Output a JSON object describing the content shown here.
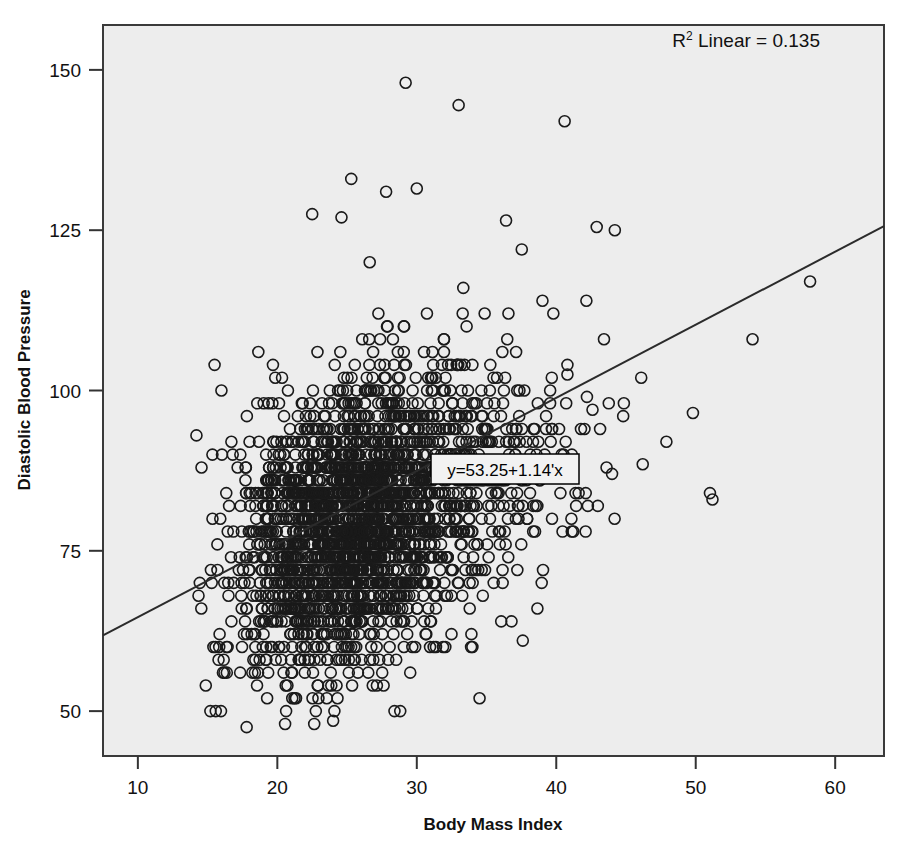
{
  "chart_data": {
    "type": "scatter",
    "title": "",
    "xlabel": "Body Mass Index",
    "ylabel": "Diastolic Blood Pressure",
    "xlim": [
      7.5,
      63.5
    ],
    "ylim": [
      43,
      157
    ],
    "xticks": [
      10,
      20,
      30,
      40,
      50,
      60
    ],
    "xtick_labels": [
      "10",
      "20",
      "30",
      "40",
      "50",
      "60"
    ],
    "yticks": [
      50,
      75,
      100,
      125,
      150
    ],
    "ytick_labels": [
      "50",
      "75",
      "100",
      "125",
      "150"
    ],
    "grid": false,
    "legend": "none",
    "marker": "open-circle",
    "marker_size_px": 11,
    "marker_color": "#1a1a1a",
    "plot_background": "#ededed",
    "page_background": "#ffffff",
    "frame_color": "#3a3a3a",
    "annotations": [
      {
        "name": "r-squared-label",
        "text_prefix": "R",
        "text_superscript": "2",
        "text_suffix": " Linear = 0.135",
        "full_text": "R2 Linear = 0.135",
        "x_px": 820,
        "y_px": 47,
        "anchor": "end",
        "boxed": false
      },
      {
        "name": "regression-equation-label",
        "full_text": "y=53.25+1.14'x",
        "x_px": 505,
        "y_px": 470,
        "anchor": "middle",
        "boxed": true,
        "box_fill": "#f2f2f2",
        "box_stroke": "#000000"
      }
    ],
    "fit_line": {
      "name": "linear-regression-line",
      "equation": "y=53.25+1.14'x",
      "intercept": 53.25,
      "slope": 1.14,
      "r_squared": 0.135,
      "color": "#2b2b2b",
      "width_px": 2,
      "x_start": 7.5,
      "x_end": 63.5,
      "y_start": 61.8,
      "y_end": 125.6
    },
    "scatter_summary": {
      "n_points_approx": 2600,
      "x_center": 26.0,
      "y_center": 80.0,
      "x_sd": 4.4,
      "y_sd": 11.5,
      "correlation": 0.367,
      "x_min": 14.2,
      "x_max": 58.2,
      "y_min": 47.0,
      "y_max": 148.0,
      "y_quantization": 2.0,
      "note": "Heavily overplotted core between BMI 20-32 and DBP 60-95; sparse outliers to BMI 58 and DBP 148"
    },
    "outlier_points": [
      {
        "x": 29.2,
        "y": 148.0
      },
      {
        "x": 33.0,
        "y": 144.5
      },
      {
        "x": 40.6,
        "y": 142.0
      },
      {
        "x": 25.3,
        "y": 133.0
      },
      {
        "x": 27.8,
        "y": 131.0
      },
      {
        "x": 30.0,
        "y": 131.5
      },
      {
        "x": 22.5,
        "y": 127.5
      },
      {
        "x": 24.6,
        "y": 127.0
      },
      {
        "x": 36.4,
        "y": 126.5
      },
      {
        "x": 42.9,
        "y": 125.5
      },
      {
        "x": 44.2,
        "y": 125.0
      },
      {
        "x": 14.2,
        "y": 93.0
      },
      {
        "x": 15.5,
        "y": 104.0
      },
      {
        "x": 17.8,
        "y": 47.5
      },
      {
        "x": 24.0,
        "y": 48.5
      },
      {
        "x": 28.4,
        "y": 50.0
      },
      {
        "x": 34.5,
        "y": 52.0
      },
      {
        "x": 37.6,
        "y": 61.0
      },
      {
        "x": 44.0,
        "y": 87.0
      },
      {
        "x": 46.2,
        "y": 88.5
      },
      {
        "x": 49.8,
        "y": 96.5
      },
      {
        "x": 51.2,
        "y": 83.0
      },
      {
        "x": 58.2,
        "y": 117.0
      },
      {
        "x": 40.8,
        "y": 102.5
      },
      {
        "x": 40.8,
        "y": 104.0
      },
      {
        "x": 42.6,
        "y": 97.0
      },
      {
        "x": 42.2,
        "y": 99.0
      }
    ]
  },
  "axes": {
    "x_axis_name": "bmi-axis",
    "y_axis_name": "dbp-axis"
  }
}
